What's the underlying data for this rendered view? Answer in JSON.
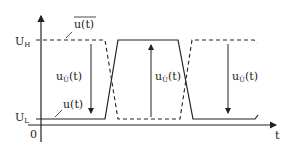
{
  "diagram": {
    "type": "signal-timing",
    "axes": {
      "x_label": "t",
      "origin_label": "0"
    },
    "levels": {
      "high": {
        "main": "U",
        "sub": "H"
      },
      "low": {
        "main": "U",
        "sub": "L"
      }
    },
    "signals": {
      "u": {
        "label": "u(t)",
        "style": "solid"
      },
      "u_bar": {
        "label": "u(t)",
        "overline": true,
        "style": "dashed"
      }
    },
    "arrows": [
      {
        "label_main": "u",
        "label_sub": "Ü",
        "label_suffix": "(t)",
        "direction": "down"
      },
      {
        "label_main": "u",
        "label_sub": "Ü",
        "label_suffix": "(t)",
        "direction": "up"
      },
      {
        "label_main": "u",
        "label_sub": "Ü",
        "label_suffix": "(t)",
        "direction": "down"
      }
    ],
    "colors": {
      "stroke": "#222222",
      "background": "#ffffff"
    }
  }
}
